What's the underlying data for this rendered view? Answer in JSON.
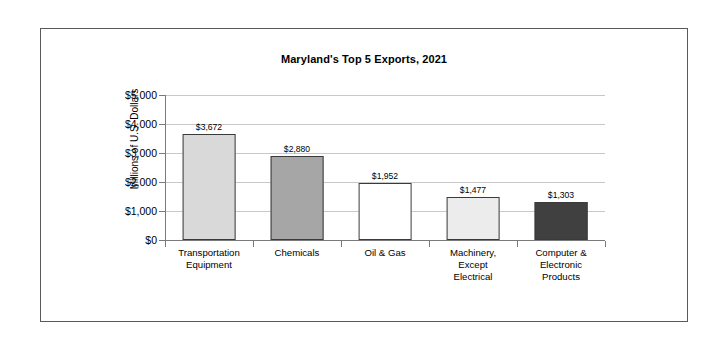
{
  "chart_data": {
    "type": "bar",
    "title": "Maryland's Top 5 Exports, 2021",
    "xlabel": "",
    "ylabel": "Millions of U.S. Dollars",
    "ylim": [
      0,
      5000
    ],
    "ytick_step": 1000,
    "ytick_labels": [
      "$5,000",
      "$4,000",
      "$3,000",
      "$2,000",
      "$1,000",
      "$0"
    ],
    "ytick_values": [
      5000,
      4000,
      3000,
      2000,
      1000,
      0
    ],
    "grid": "horizontal",
    "legend": "none",
    "categories": [
      "Transportation Equipment",
      "Chemicals",
      "Oil & Gas",
      "Machinery, Except Electrical",
      "Computer & Electronic Products"
    ],
    "category_lines": [
      [
        "Transportation",
        "Equipment"
      ],
      [
        "Chemicals"
      ],
      [
        "Oil & Gas"
      ],
      [
        "Machinery,",
        "Except",
        "Electrical"
      ],
      [
        "Computer &",
        "Electronic",
        "Products"
      ]
    ],
    "values": [
      3672,
      2880,
      1952,
      1477,
      1303
    ],
    "data_labels": [
      "$3,672",
      "$2,880",
      "$1,952",
      "$1,477",
      "$1,303"
    ],
    "bar_colors": [
      "#d9d9d9",
      "#a6a6a6",
      "#ffffff",
      "#ececec",
      "#404040"
    ],
    "bar_border_color": "#3a3a3a",
    "gridline_color": "#c8c8c8",
    "axis_color": "#7a7a7a"
  }
}
